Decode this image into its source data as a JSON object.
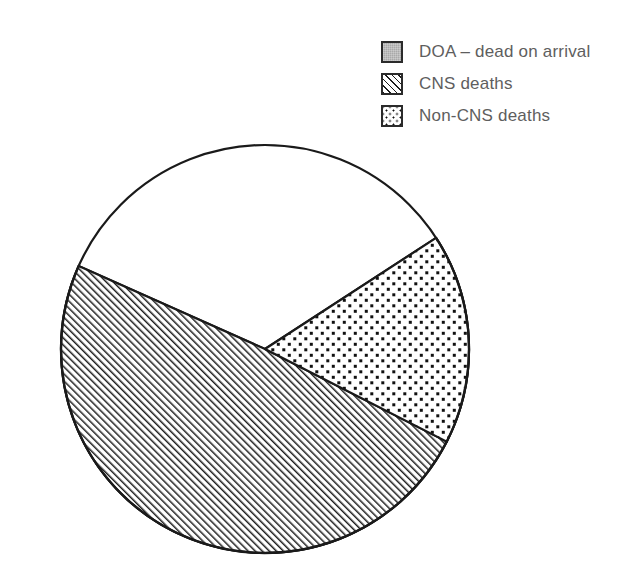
{
  "legend": {
    "position": "top-right",
    "items": [
      {
        "label": "DOA – dead on arrival",
        "swatch": "solid-gray-swatch",
        "pattern": "solid",
        "color": "#a9a9a9"
      },
      {
        "label": "CNS deaths",
        "swatch": "diagonal-hatch-swatch",
        "pattern": "diagonal-hatch",
        "color": "#ffffff"
      },
      {
        "label": "Non-CNS deaths",
        "swatch": "dotted-swatch",
        "pattern": "dots",
        "color": "#ffffff"
      }
    ]
  },
  "chart_data": {
    "type": "pie",
    "title": "",
    "xlabel": "",
    "ylabel": "",
    "grid": false,
    "legend_position": "top-right",
    "categories": [
      "DOA – dead on arrival",
      "CNS deaths",
      "Non-CNS deaths"
    ],
    "values": [
      47,
      33,
      20
    ],
    "unit": "percent",
    "series": [
      {
        "name": "Cause of death",
        "values": [
          47,
          33,
          20
        ]
      }
    ],
    "slices": [
      {
        "label": "DOA – dead on arrival",
        "value": 47,
        "pattern": "solid",
        "color": "#a9a9a9",
        "start_angle_deg": -33,
        "end_angle_deg": 204
      },
      {
        "label": "CNS deaths",
        "value": 33,
        "pattern": "diagonal-hatch",
        "color": "#ffffff",
        "start_angle_deg": 27,
        "end_angle_deg": 204
      },
      {
        "label": "Non-CNS deaths",
        "value": 20,
        "pattern": "dots",
        "color": "#ffffff",
        "start_angle_deg": -33,
        "end_angle_deg": 27
      }
    ],
    "geometry": {
      "center_x": 265,
      "center_y": 349,
      "radius": 204
    },
    "outline_color": "#1a1a1a"
  }
}
